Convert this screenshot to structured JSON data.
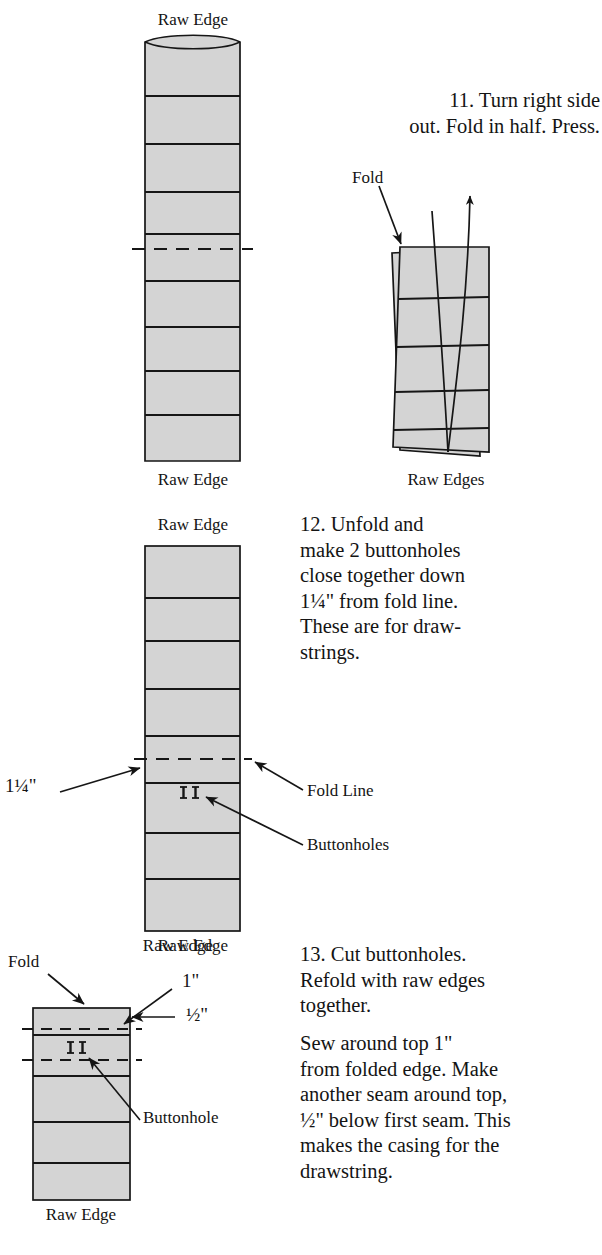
{
  "document": {
    "kind": "sewing-instruction-diagram",
    "page_background": "#ffffff",
    "fabric_fill": "#d4d4d4",
    "ink_color": "#161616"
  },
  "steps": [
    {
      "number": "11",
      "text": "11. Turn right side\nout. Fold in half. Press.",
      "line1": "11. Turn right side",
      "line2": "out. Fold in half. Press."
    },
    {
      "number": "12",
      "text": "12. Unfold and\nmake 2 buttonholes\nclose together down\n1¼\" from fold line.\nThese are for draw-\nstrings.",
      "lines": [
        "12. Unfold and",
        "make 2 buttonholes",
        "close together down",
        "1¼\" from fold line.",
        "These are for draw-",
        "strings."
      ]
    },
    {
      "number": "13",
      "paragraph1": "13. Cut buttonholes.\nRefold with raw edges\ntogether.",
      "paragraph2": "Sew around top 1\"\nfrom folded edge. Make\nanother seam around top,\n½\" below first seam. This\nmakes the casing for the\ndrawstring.",
      "p1_lines": [
        "13. Cut buttonholes.",
        "Refold with raw edges",
        "together."
      ],
      "p2_lines": [
        "Sew around top 1\"",
        "from folded edge. Make",
        "another seam around top,",
        "½\" below first seam. This",
        "makes the casing for the",
        "drawstring."
      ]
    }
  ],
  "diagram_a": {
    "name": "unfolded-strip-step-11",
    "top_label": "Raw Edge",
    "bottom_label": "Raw Edge",
    "fold_line_style": "dashed",
    "segment_count": 9,
    "curved_top_edge": true
  },
  "diagram_b": {
    "name": "folded-strip-step-11",
    "bottom_label": "Raw Edges",
    "fold_label": "Fold",
    "layers": 2,
    "has_curved_arrow": true
  },
  "diagram_c": {
    "name": "unfolded-strip-step-12",
    "top_label": "Raw Edge",
    "bottom_label": "Raw Edge",
    "left_dimension": "1¼\"",
    "fold_line_label": "Fold Line",
    "buttonholes_label": "Buttonholes",
    "buttonhole_count": 2
  },
  "diagram_d": {
    "name": "refolded-strip-step-13",
    "fold_label": "Fold",
    "top_label": "Raw Edge",
    "bottom_label": "Raw Edge",
    "seam1_dimension": "1\"",
    "seam2_dimension": "½\"",
    "buttonhole_label": "Buttonhole",
    "buttonhole_count": 2
  },
  "fractions": {
    "one_and_quarter": "1¼\"",
    "one_inch": "1\"",
    "half_inch": "½\""
  }
}
